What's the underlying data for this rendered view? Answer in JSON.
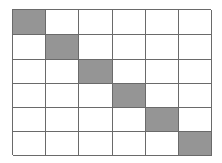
{
  "diagram": {
    "type": "grid",
    "rows": 6,
    "columns": 6,
    "filled_cells": [
      [
        0,
        0
      ],
      [
        1,
        1
      ],
      [
        2,
        2
      ],
      [
        3,
        3
      ],
      [
        4,
        4
      ],
      [
        5,
        5
      ]
    ],
    "colors": {
      "fill": "#959595",
      "empty": "#ffffff",
      "line": "#6a6a6a",
      "background": "#ffffff"
    }
  }
}
